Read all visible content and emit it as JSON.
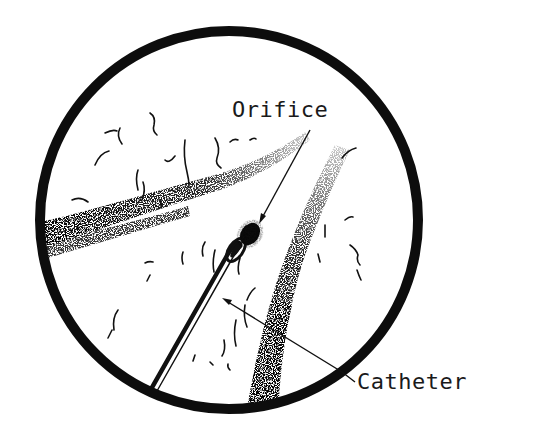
{
  "figure": {
    "type": "anatomical-line-drawing",
    "view": "circular endoscopic field of view",
    "colors": {
      "ink": "#111111",
      "background": "#ffffff"
    }
  },
  "labels": {
    "orifice": "Orifice",
    "catheter": "Catheter"
  },
  "annotations": [
    {
      "label": "Orifice",
      "points_to": "catheter-tip-orifice"
    },
    {
      "label": "Catheter",
      "points_to": "catheter-tube"
    }
  ]
}
